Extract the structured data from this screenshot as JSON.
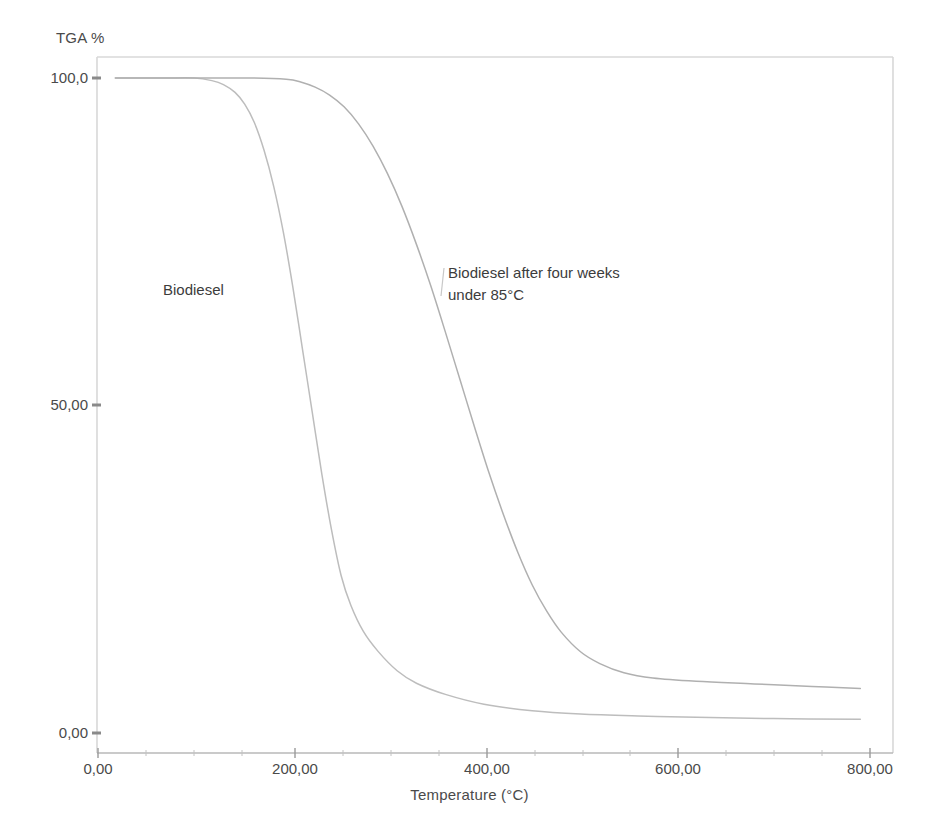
{
  "figure": {
    "background": "#ffffff",
    "frame_color": "#d6d6d6"
  },
  "axes": {
    "y_title": "TGA %",
    "x_title": "Temperature (°C)",
    "y_ticks": [
      "100,0",
      "50,00",
      "0,00"
    ],
    "x_ticks": [
      "0,00",
      "200,00",
      "400,00",
      "600,00",
      "800,00"
    ]
  },
  "annotations": {
    "curve1": "Biodiesel",
    "curve2": "Biodiesel after four weeks\nunder 85°C"
  },
  "chart_data": {
    "type": "line",
    "title": "",
    "xlabel": "Temperature (°C)",
    "ylabel": "TGA %",
    "xlim": [
      0,
      800
    ],
    "ylim": [
      0,
      100
    ],
    "xticks": [
      0,
      200,
      400,
      600,
      800
    ],
    "xticklabels": [
      "0,00",
      "200,00",
      "400,00",
      "600,00",
      "800,00"
    ],
    "yticks": [
      0,
      50,
      100
    ],
    "yticklabels": [
      "0,00",
      "50,00",
      "100,0"
    ],
    "grid": false,
    "legend": "none (inline curve annotations)",
    "line_color": "#b9b9b9",
    "series": [
      {
        "name": "Biodiesel",
        "annotation": "Biodiesel",
        "color": "#bdbdbd",
        "x": [
          18,
          40,
          70,
          100,
          118,
          130,
          142,
          152,
          162,
          172,
          182,
          192,
          202,
          212,
          222,
          232,
          242,
          252,
          262,
          275,
          290,
          310,
          330,
          360,
          400,
          450,
          500,
          560,
          620,
          700,
          790
        ],
        "y": [
          100,
          100,
          100,
          100,
          99.6,
          99.0,
          97.8,
          96.0,
          93.2,
          89.0,
          83.5,
          76.5,
          68.0,
          58.5,
          49.0,
          39.5,
          31.0,
          24.0,
          19.5,
          15.5,
          12.5,
          9.5,
          7.6,
          5.9,
          4.4,
          3.4,
          2.9,
          2.6,
          2.4,
          2.2,
          2.1
        ]
      },
      {
        "name": "Biodiesel after four weeks under 85°C",
        "annotation": "Biodiesel after four weeks under 85°C",
        "color": "#b0b0b0",
        "x": [
          18,
          60,
          110,
          160,
          195,
          210,
          225,
          240,
          255,
          270,
          285,
          300,
          315,
          330,
          345,
          360,
          375,
          390,
          405,
          420,
          435,
          450,
          465,
          480,
          500,
          520,
          545,
          575,
          620,
          680,
          740,
          790
        ],
        "y": [
          100,
          100,
          100,
          100,
          99.8,
          99.4,
          98.6,
          97.4,
          95.6,
          93.0,
          89.6,
          85.4,
          80.4,
          74.6,
          68.2,
          61.2,
          54.0,
          46.8,
          39.8,
          33.4,
          27.6,
          22.6,
          18.6,
          15.4,
          12.4,
          10.6,
          9.2,
          8.4,
          7.9,
          7.5,
          7.1,
          6.8
        ]
      }
    ]
  }
}
